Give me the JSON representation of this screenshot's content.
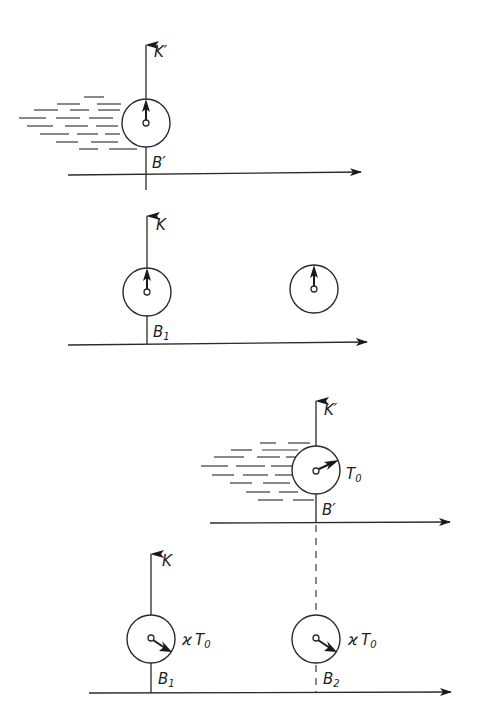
{
  "figure": {
    "colors": {
      "ink": "#2a2a2a",
      "background": "#ffffff"
    },
    "panel_a": {
      "moving_frame_label": "K′",
      "moving_clock_label": "B′"
    },
    "panel_b": {
      "rest_frame_label": "K",
      "clock_label": "B",
      "clock_subscript": "1"
    },
    "panel_c": {
      "moving_frame_label": "K′",
      "moving_clock_label": "B′",
      "moving_clock_reading": "T",
      "moving_clock_reading_sub": "0"
    },
    "panel_d": {
      "rest_frame_label": "K",
      "clock1_label": "B",
      "clock1_subscript": "1",
      "clock2_label": "B",
      "clock2_subscript": "2",
      "clock_reading_prefix": "ϰ",
      "clock_reading": "T",
      "clock_reading_sub": "0"
    }
  }
}
